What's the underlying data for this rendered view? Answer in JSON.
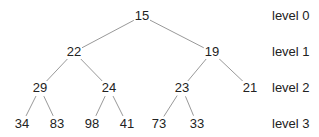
{
  "diagram": {
    "type": "binary-tree",
    "edge_color": "#999999",
    "nodes": [
      {
        "id": "n0",
        "value": "15",
        "x": 142,
        "y": 16,
        "parent": null
      },
      {
        "id": "n1",
        "value": "22",
        "x": 74,
        "y": 52,
        "parent": "n0"
      },
      {
        "id": "n2",
        "value": "19",
        "x": 212,
        "y": 52,
        "parent": "n0"
      },
      {
        "id": "n3",
        "value": "29",
        "x": 40,
        "y": 88,
        "parent": "n1"
      },
      {
        "id": "n4",
        "value": "24",
        "x": 109,
        "y": 88,
        "parent": "n1"
      },
      {
        "id": "n5",
        "value": "23",
        "x": 182,
        "y": 88,
        "parent": "n2"
      },
      {
        "id": "n6",
        "value": "21",
        "x": 250,
        "y": 88,
        "parent": "n2"
      },
      {
        "id": "n7",
        "value": "34",
        "x": 22,
        "y": 124,
        "parent": "n3"
      },
      {
        "id": "n8",
        "value": "83",
        "x": 57,
        "y": 124,
        "parent": "n3"
      },
      {
        "id": "n9",
        "value": "98",
        "x": 92,
        "y": 124,
        "parent": "n4"
      },
      {
        "id": "n10",
        "value": "41",
        "x": 127,
        "y": 124,
        "parent": "n4"
      },
      {
        "id": "n11",
        "value": "73",
        "x": 159,
        "y": 124,
        "parent": "n5"
      },
      {
        "id": "n12",
        "value": "33",
        "x": 197,
        "y": 124,
        "parent": "n5"
      }
    ],
    "levels": [
      {
        "label": "level 0",
        "y": 16
      },
      {
        "label": "level 1",
        "y": 52
      },
      {
        "label": "level 2",
        "y": 88
      },
      {
        "label": "level 3",
        "y": 124
      }
    ]
  }
}
